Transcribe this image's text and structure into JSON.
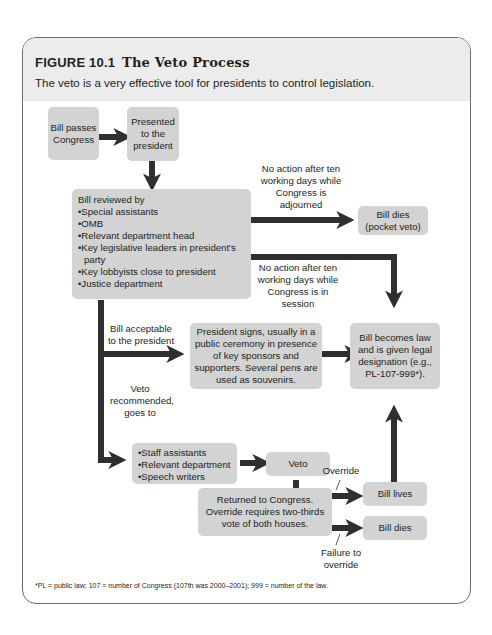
{
  "figure": {
    "label": "FIGURE 10.1",
    "title": "The Veto Process",
    "subtitle": "The veto is a very effective tool for presidents to control legislation.",
    "footnote": "*PL = public law; 107 = number of Congress (107th was 2000–2001); 999 = number of the law."
  },
  "nodes": {
    "bill_passes": "Bill passes Congress",
    "presented": "Presented to the president",
    "reviewed_title": "Bill reviewed by",
    "reviewed_items": [
      "Special assistants",
      "OMB",
      "Relevant department head",
      "Key legislative leaders in president's",
      "party",
      "Key lobbyists close to president",
      "Justice department"
    ],
    "pocket_veto": "Bill dies (pocket veto)",
    "president_signs": "President signs, usually in a public ceremony in presence of key sponsors and supporters. Several pens are used as souvenirs.",
    "becomes_law": "Bill becomes law and is given legal designation (e.g., PL-107-999*).",
    "veto_staff_items": [
      "Staff assistants",
      "Relevant department",
      "Speech writers"
    ],
    "veto": "Veto",
    "returned": "Returned to Congress. Override requires two-thirds vote of both houses.",
    "bill_lives": "Bill lives",
    "bill_dies": "Bill dies"
  },
  "edge_labels": {
    "adjourned": "No action after ten working days while Congress is adjourned",
    "in_session": "No action after ten working days while Congress is in session",
    "acceptable": "Bill acceptable to the president",
    "veto_recommended": "Veto recommended, goes to",
    "override": "Override",
    "failure": "Failure to override"
  }
}
